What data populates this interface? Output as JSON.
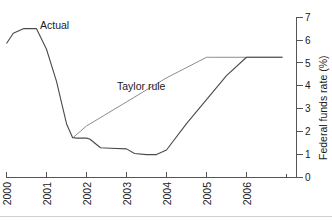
{
  "chart_data": {
    "type": "line",
    "title": "",
    "xlabel": "",
    "ylabel": "Federal funds rate (%)",
    "ylim": [
      0,
      7
    ],
    "xlim": [
      2000,
      2006.9
    ],
    "grid": false,
    "legend_position": "inline-annotation",
    "x_ticks": [
      "2000",
      "2001",
      "2002",
      "2003",
      "2004",
      "2005",
      "2006"
    ],
    "x_tick_values": [
      2000,
      2001,
      2002,
      2003,
      2004,
      2005,
      2006
    ],
    "y_ticks": [
      "0",
      "1",
      "2",
      "3",
      "4",
      "5",
      "6",
      "7"
    ],
    "y_tick_values": [
      0,
      1,
      2,
      3,
      4,
      5,
      6,
      7
    ],
    "annotations": [
      {
        "text": "Actual",
        "x": 2000.55,
        "y": 6.75
      },
      {
        "text": "Taylor rule",
        "x": 2002.45,
        "y": 4.25
      }
    ],
    "series": [
      {
        "name": "Actual",
        "color": "#4a4a4a",
        "x": [
          2000.0,
          2000.17,
          2000.42,
          2000.75,
          2001.0,
          2001.25,
          2001.5,
          2001.65,
          2001.75,
          2002.0,
          2002.08,
          2002.35,
          2002.6,
          2003.0,
          2003.2,
          2003.5,
          2003.75,
          2004.0,
          2004.5,
          2005.0,
          2005.5,
          2006.0,
          2006.15,
          2006.5,
          2006.9
        ],
        "y": [
          5.85,
          6.3,
          6.5,
          6.5,
          5.6,
          4.2,
          2.35,
          1.75,
          1.72,
          1.72,
          1.68,
          1.3,
          1.28,
          1.25,
          1.05,
          1.0,
          1.0,
          1.2,
          2.35,
          3.4,
          4.45,
          5.25,
          5.25,
          5.25,
          5.25
        ]
      },
      {
        "name": "Taylor rule",
        "color": "#8d8d8d",
        "x": [
          2001.65,
          2002.0,
          2003.0,
          2004.0,
          2005.0,
          2005.1,
          2006.0,
          2006.9
        ],
        "y": [
          1.72,
          2.25,
          3.3,
          4.35,
          5.25,
          5.25,
          5.25,
          5.25
        ]
      }
    ]
  },
  "axis": {
    "y_axis_title": "Federal funds rate (%)"
  }
}
